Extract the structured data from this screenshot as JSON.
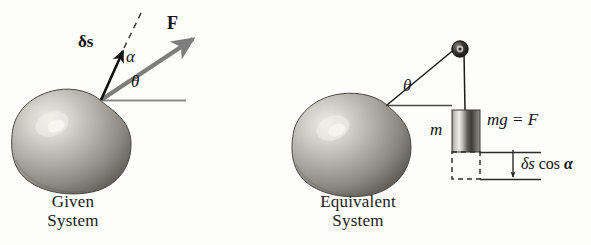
{
  "figure": {
    "width": 591,
    "height": 245,
    "background": "#fdfdfb",
    "type": "physics-diagram",
    "topic": "virtual work: given system vs equivalent system"
  },
  "colors": {
    "ink": "#111111",
    "force_vector": "#7d7d7d",
    "reference_line": "#8a8a8a",
    "sphere_mid": "#a9a7a2",
    "sphere_dark": "#6d6b66",
    "sphere_light": "#e6e4de",
    "dashed": "#3a3a3a"
  },
  "left_panel": {
    "caption_line1": "Given",
    "caption_line2": "System",
    "labels": {
      "displacement": "δs",
      "force": "F",
      "alpha": "α",
      "theta": "θ"
    },
    "sphere": {
      "cx": 72,
      "cy": 140,
      "rx": 58,
      "ry": 52
    },
    "vectors": {
      "displacement_from": [
        101,
        100
      ],
      "displacement_to": [
        124,
        48
      ],
      "force_from": [
        101,
        100
      ],
      "force_to": [
        197,
        37
      ],
      "dashed_to": [
        141,
        12
      ],
      "reference_from": [
        101,
        100
      ],
      "reference_to": [
        185,
        100
      ]
    }
  },
  "right_panel": {
    "caption_line1": "Equivalent",
    "caption_line2": "System",
    "labels": {
      "theta": "θ",
      "mass": "m",
      "weight": "mg = F",
      "drop_delta": "δs",
      "drop_cos": "cos",
      "drop_alpha": "α",
      "drop_full": "δs cos α"
    },
    "sphere": {
      "cx": 353,
      "cy": 143,
      "rx": 56,
      "ry": 50
    },
    "pulley": {
      "cx": 460,
      "cy": 50,
      "r_outer": 7,
      "r_inner": 3.2
    },
    "cord": {
      "sphere_attach": [
        387,
        105
      ],
      "pulley": [
        460,
        50
      ],
      "block_top": [
        461,
        110
      ]
    },
    "block": {
      "x": 452,
      "y": 110,
      "w": 28,
      "h": 42
    },
    "ghost_block": {
      "x": 452,
      "y": 152,
      "w": 28,
      "h": 27
    },
    "dimension": {
      "upper_line_y": 152,
      "lower_line_y": 179,
      "arrow_x": 513,
      "line_from_x": 452,
      "line_to_x": 540
    }
  }
}
